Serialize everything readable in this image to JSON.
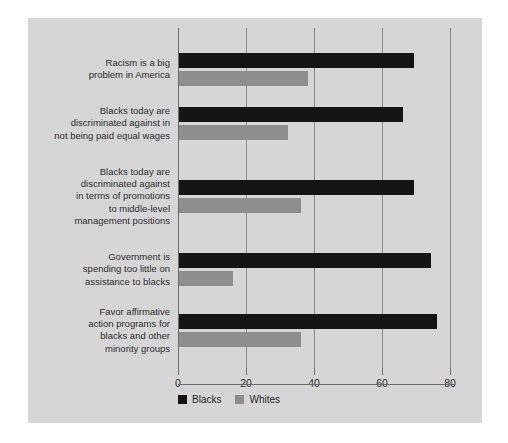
{
  "chart_data": {
    "type": "bar",
    "orientation": "horizontal",
    "title": "",
    "xlabel": "",
    "ylabel": "",
    "xlim": [
      0,
      80
    ],
    "xticks": [
      0,
      20,
      40,
      60,
      80
    ],
    "xticklabels": [
      "0",
      "20",
      "40",
      "60",
      "80"
    ],
    "grid": true,
    "legend_position": "bottom",
    "categories": [
      "Racism is a big\nproblem in America",
      "Blacks today are\ndiscriminated against in\nnot being paid equal wages",
      "Blacks today are\ndiscriminated against\nin terms of promotions\nto middle-level\nmanagement positions",
      "Government is\nspending too little on\nassistance to blacks",
      "Favor affirmative\naction programs for\nblacks and other\nminority groups"
    ],
    "series": [
      {
        "name": "Blacks",
        "color": "#141414",
        "values": [
          69,
          66,
          69,
          74,
          76
        ]
      },
      {
        "name": "Whites",
        "color": "#8e8e8e",
        "values": [
          38,
          32,
          36,
          16,
          36
        ]
      }
    ]
  },
  "legend": {
    "items": [
      {
        "label": "Blacks",
        "color": "#141414"
      },
      {
        "label": "Whites",
        "color": "#8e8e8e"
      }
    ]
  },
  "colors": {
    "panel_background": "#d6d6d6",
    "page_background": "#ffffff",
    "gridline": "#8c8c8c",
    "axis": "#6d6d6d",
    "text": "#2d2d2d"
  }
}
